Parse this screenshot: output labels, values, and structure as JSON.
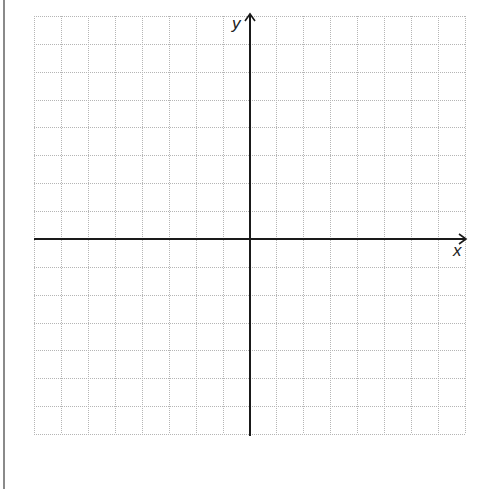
{
  "diagram": {
    "type": "coordinate-grid",
    "x_axis_label": "x",
    "y_axis_label": "y",
    "grid": {
      "columns": 16,
      "rows": 15,
      "left": 34,
      "top": 16,
      "right": 465,
      "bottom": 434,
      "y_axis_column": 8,
      "x_axis_row": 8,
      "line_style": "dotted",
      "grid_color": "#b5b5b5",
      "axis_color": "#1a1a1a"
    }
  }
}
